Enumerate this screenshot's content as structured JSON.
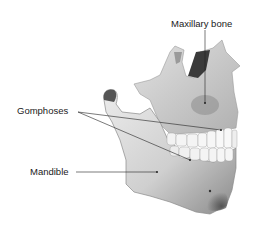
{
  "figure": {
    "labels": {
      "maxillary": "Maxillary bone",
      "gomphoses": "Gomphoses",
      "mandible": "Mandible"
    },
    "colors": {
      "background": "#ffffff",
      "bone_light": "#e6e6e6",
      "bone_mid": "#c4c4c4",
      "bone_dark": "#6a6a6a",
      "teeth": "#f4f4f4",
      "leader_line": "#222222",
      "text": "#1a1a1a"
    }
  }
}
